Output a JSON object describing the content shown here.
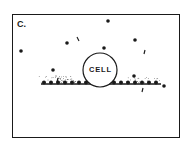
{
  "figure": {
    "panel_label": "C.",
    "cell_label": "CELL",
    "colors": {
      "ink": "#1a1a1a",
      "background": "#ffffff"
    },
    "cell": {
      "cx": 87,
      "cy": 55,
      "r": 17
    },
    "surface": {
      "x1": 28,
      "x2": 148,
      "y": 69
    },
    "dots": [
      [
        8,
        36
      ],
      [
        95,
        6
      ],
      [
        54,
        28
      ],
      [
        122,
        25
      ],
      [
        91,
        33
      ],
      [
        40,
        55
      ],
      [
        121,
        61
      ],
      [
        151,
        71
      ]
    ],
    "dashes": [
      [
        64,
        22,
        66,
        26
      ],
      [
        132,
        35,
        131,
        39
      ],
      [
        88,
        45,
        86,
        49
      ],
      [
        45,
        63,
        44,
        67
      ],
      [
        130,
        73,
        129,
        77
      ]
    ]
  }
}
